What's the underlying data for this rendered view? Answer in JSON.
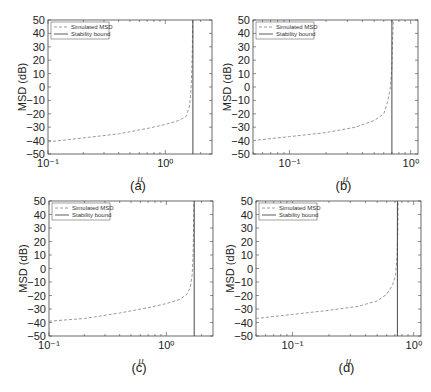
{
  "figure": {
    "legend": [
      "Simulated MSD",
      "Stability bound"
    ],
    "ylabel": "MSD (dB)",
    "xlabel": "μ"
  },
  "colors": {
    "simulated": "#9a9a9a",
    "bound": "#333333",
    "axes": "#444444"
  },
  "chart_data": [
    {
      "type": "line",
      "caption": "(a)",
      "xscale": "log",
      "xlim": [
        0.1,
        2.5
      ],
      "ylim": [
        -50,
        50
      ],
      "xticks": [
        {
          "value": 0.1,
          "label": "10⁻¹"
        },
        {
          "value": 1,
          "label": "10⁰"
        }
      ],
      "yticks": [
        50,
        40,
        30,
        20,
        10,
        0,
        -10,
        -20,
        -30,
        -40,
        -50
      ],
      "xlabel": "μ",
      "ylabel": "MSD (dB)",
      "legend": [
        "Simulated MSD",
        "Stability bound"
      ],
      "legend_position": "upper left",
      "series": [
        {
          "name": "Simulated MSD",
          "style": "dashed",
          "x": [
            0.1,
            0.2,
            0.4,
            0.7,
            1.0,
            1.3,
            1.5,
            1.6,
            1.65,
            1.68,
            1.7,
            1.71
          ],
          "y": [
            -41,
            -38,
            -35,
            -31,
            -28,
            -25,
            -22,
            -15,
            -5,
            10,
            30,
            50
          ]
        },
        {
          "name": "Stability bound",
          "style": "solid",
          "x": [
            1.72,
            1.72
          ],
          "y": [
            -50,
            50
          ]
        }
      ]
    },
    {
      "type": "line",
      "caption": "(b)",
      "xscale": "log",
      "xlim": [
        0.05,
        1.15
      ],
      "ylim": [
        -50,
        50
      ],
      "xticks": [
        {
          "value": 0.1,
          "label": "10⁻¹"
        },
        {
          "value": 1,
          "label": "10⁰"
        }
      ],
      "yticks": [
        50,
        40,
        30,
        20,
        10,
        0,
        -10,
        -20,
        -30,
        -40,
        -50
      ],
      "xlabel": "μ",
      "ylabel": "MSD (dB)",
      "legend": [
        "Simulated MSD",
        "Stability bound"
      ],
      "legend_position": "upper left",
      "series": [
        {
          "name": "Simulated MSD",
          "style": "dashed",
          "x": [
            0.05,
            0.1,
            0.2,
            0.35,
            0.5,
            0.6,
            0.65,
            0.68,
            0.7,
            0.71,
            0.72
          ],
          "y": [
            -40,
            -37,
            -34,
            -30,
            -25,
            -20,
            -10,
            0,
            15,
            35,
            50
          ]
        },
        {
          "name": "Stability bound",
          "style": "solid",
          "x": [
            0.7,
            0.7
          ],
          "y": [
            -50,
            50
          ]
        }
      ]
    },
    {
      "type": "line",
      "caption": "(c)",
      "xscale": "log",
      "xlim": [
        0.1,
        2.5
      ],
      "ylim": [
        -50,
        50
      ],
      "xticks": [
        {
          "value": 0.1,
          "label": "10⁻¹"
        },
        {
          "value": 1,
          "label": "10⁰"
        }
      ],
      "yticks": [
        50,
        40,
        30,
        20,
        10,
        0,
        -10,
        -20,
        -30,
        -40,
        -50
      ],
      "xlabel": "μ",
      "ylabel": "MSD (dB)",
      "legend": [
        "Simulated MSD",
        "Stability bound"
      ],
      "legend_position": "upper left",
      "series": [
        {
          "name": "Simulated MSD",
          "style": "dashed",
          "x": [
            0.1,
            0.2,
            0.4,
            0.7,
            1.0,
            1.3,
            1.5,
            1.6,
            1.66,
            1.69,
            1.71,
            1.72
          ],
          "y": [
            -39,
            -37,
            -33,
            -29,
            -26,
            -23,
            -19,
            -14,
            -5,
            10,
            30,
            50
          ]
        },
        {
          "name": "Stability bound",
          "style": "solid",
          "x": [
            1.73,
            1.73
          ],
          "y": [
            -50,
            50
          ]
        }
      ]
    },
    {
      "type": "line",
      "caption": "(d)",
      "xscale": "log",
      "xlim": [
        0.05,
        1.15
      ],
      "ylim": [
        -50,
        50
      ],
      "xticks": [
        {
          "value": 0.1,
          "label": "10⁻¹"
        },
        {
          "value": 1,
          "label": "10⁰"
        }
      ],
      "yticks": [
        50,
        40,
        30,
        20,
        10,
        0,
        -10,
        -20,
        -30,
        -40,
        -50
      ],
      "xlabel": "μ",
      "ylabel": "MSD (dB)",
      "legend": [
        "Simulated MSD",
        "Stability bound"
      ],
      "legend_position": "upper left",
      "series": [
        {
          "name": "Simulated MSD",
          "style": "dashed",
          "x": [
            0.05,
            0.1,
            0.2,
            0.35,
            0.5,
            0.6,
            0.67,
            0.71,
            0.73,
            0.74,
            0.745
          ],
          "y": [
            -37,
            -34,
            -31,
            -28,
            -24,
            -19,
            -12,
            -5,
            10,
            30,
            50
          ]
        },
        {
          "name": "Stability bound",
          "style": "solid",
          "x": [
            0.735,
            0.735
          ],
          "y": [
            -50,
            50
          ]
        }
      ]
    }
  ]
}
